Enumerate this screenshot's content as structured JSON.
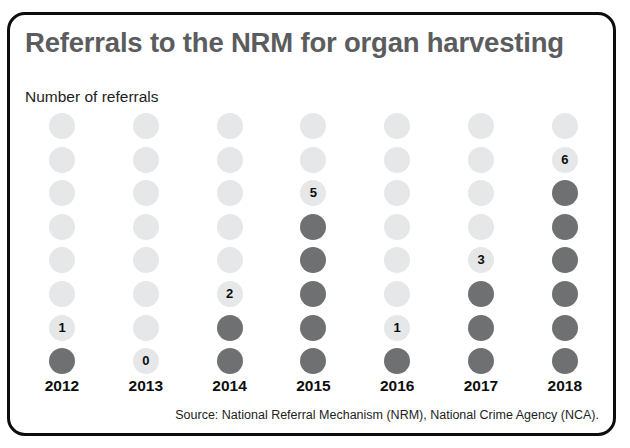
{
  "figure": {
    "title": "Referrals to the NRM for organ harvesting",
    "subtitle": "Number of referrals",
    "source": "Source: National Referral Mechanism (NRM), National Crime Agency (NCA).",
    "border_color": "#0d0d0d",
    "title_color": "#5b5c5e",
    "background": "#ffffff"
  },
  "chart_data": {
    "type": "bar",
    "variant": "dot-plot-column",
    "title": "Referrals to the NRM for organ harvesting",
    "subtitle": "Number of referrals",
    "xlabel": "",
    "ylabel": "Number of referrals",
    "categories": [
      "2012",
      "2013",
      "2014",
      "2015",
      "2016",
      "2017",
      "2018"
    ],
    "values": [
      1,
      0,
      2,
      5,
      1,
      3,
      6
    ],
    "value_labels": [
      "1",
      "0",
      "2",
      "5",
      "1",
      "3",
      "6"
    ],
    "dots_per_column": 8,
    "ylim": [
      0,
      8
    ],
    "grid": false,
    "legend": null,
    "filled_color": "#6f7072",
    "empty_color": "#e6e7e8",
    "source": "Source: National Referral Mechanism (NRM), National Crime Agency (NCA)."
  }
}
